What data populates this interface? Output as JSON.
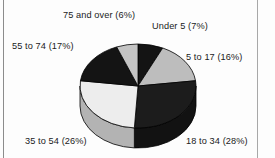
{
  "figure": {
    "background_color": "#fdfdfd",
    "rule_color": "#8c8c8c"
  },
  "chart_data": {
    "type": "pie",
    "title": "",
    "subtitle": "",
    "xlabel": "",
    "ylabel": "",
    "grid": false,
    "legend": "none",
    "style": "3d-pie",
    "start_angle_deg": 0,
    "direction": "clockwise",
    "categories": [
      "Under 5",
      "5 to 17",
      "18 to 34",
      "35 to 54",
      "55 to 74",
      "75 and over"
    ],
    "values": [
      7,
      16,
      28,
      26,
      17,
      6
    ],
    "value_unit": "%",
    "labels": [
      "Under 5  (7%)",
      "5 to 17 (16%)",
      "18 to 34 (28%)",
      "35 to 54 (26%)",
      "55 to 74 (17%)",
      "75 and over (6%)"
    ],
    "slice_colors": [
      "#141414",
      "#bdbdbd",
      "#1c1c1c",
      "#ededed",
      "#141414",
      "#c4c4c4"
    ],
    "slice_side_colors": [
      "#0d0d0d",
      "#8f8f8f",
      "#121212",
      "#b3b3b3",
      "#0d0d0d",
      "#949494"
    ],
    "slice_edge_color": "#000000"
  },
  "labels": {
    "under5": "Under 5  (7%)",
    "five_to_17": "5 to 17 (16%)",
    "eighteen_to_34": "18 to 34 (28%)",
    "thirtyfive_to_54": "35 to 54 (26%)",
    "fiftyfive_to_74": "55 to 74 (17%)",
    "seventyfive_and_over": "75 and over (6%)"
  }
}
